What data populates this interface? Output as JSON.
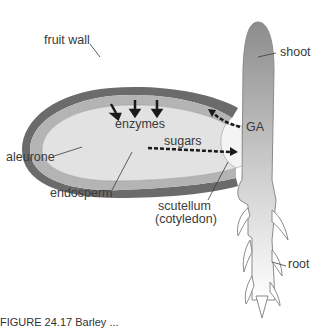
{
  "diagram": {
    "labels": {
      "fruit_wall": "fruit wall",
      "aleurone": "aleurone",
      "endosperm": "endosperm",
      "enzymes": "enzymes",
      "sugars": "sugars",
      "ga": "GA",
      "shoot": "shoot",
      "scutellum_line1": "scutellum",
      "scutellum_line2": "(cotyledon)",
      "root": "root"
    },
    "colors": {
      "fruit_wall": "#6b6b6b",
      "aleurone": "#b4b4b4",
      "endosperm": "#e2e2e2",
      "outline": "#8a8a8a",
      "arrow": "#1a1a1a",
      "text": "#3a3a3a"
    }
  },
  "caption": {
    "text": "FIGURE 24.17  Barley ..."
  }
}
